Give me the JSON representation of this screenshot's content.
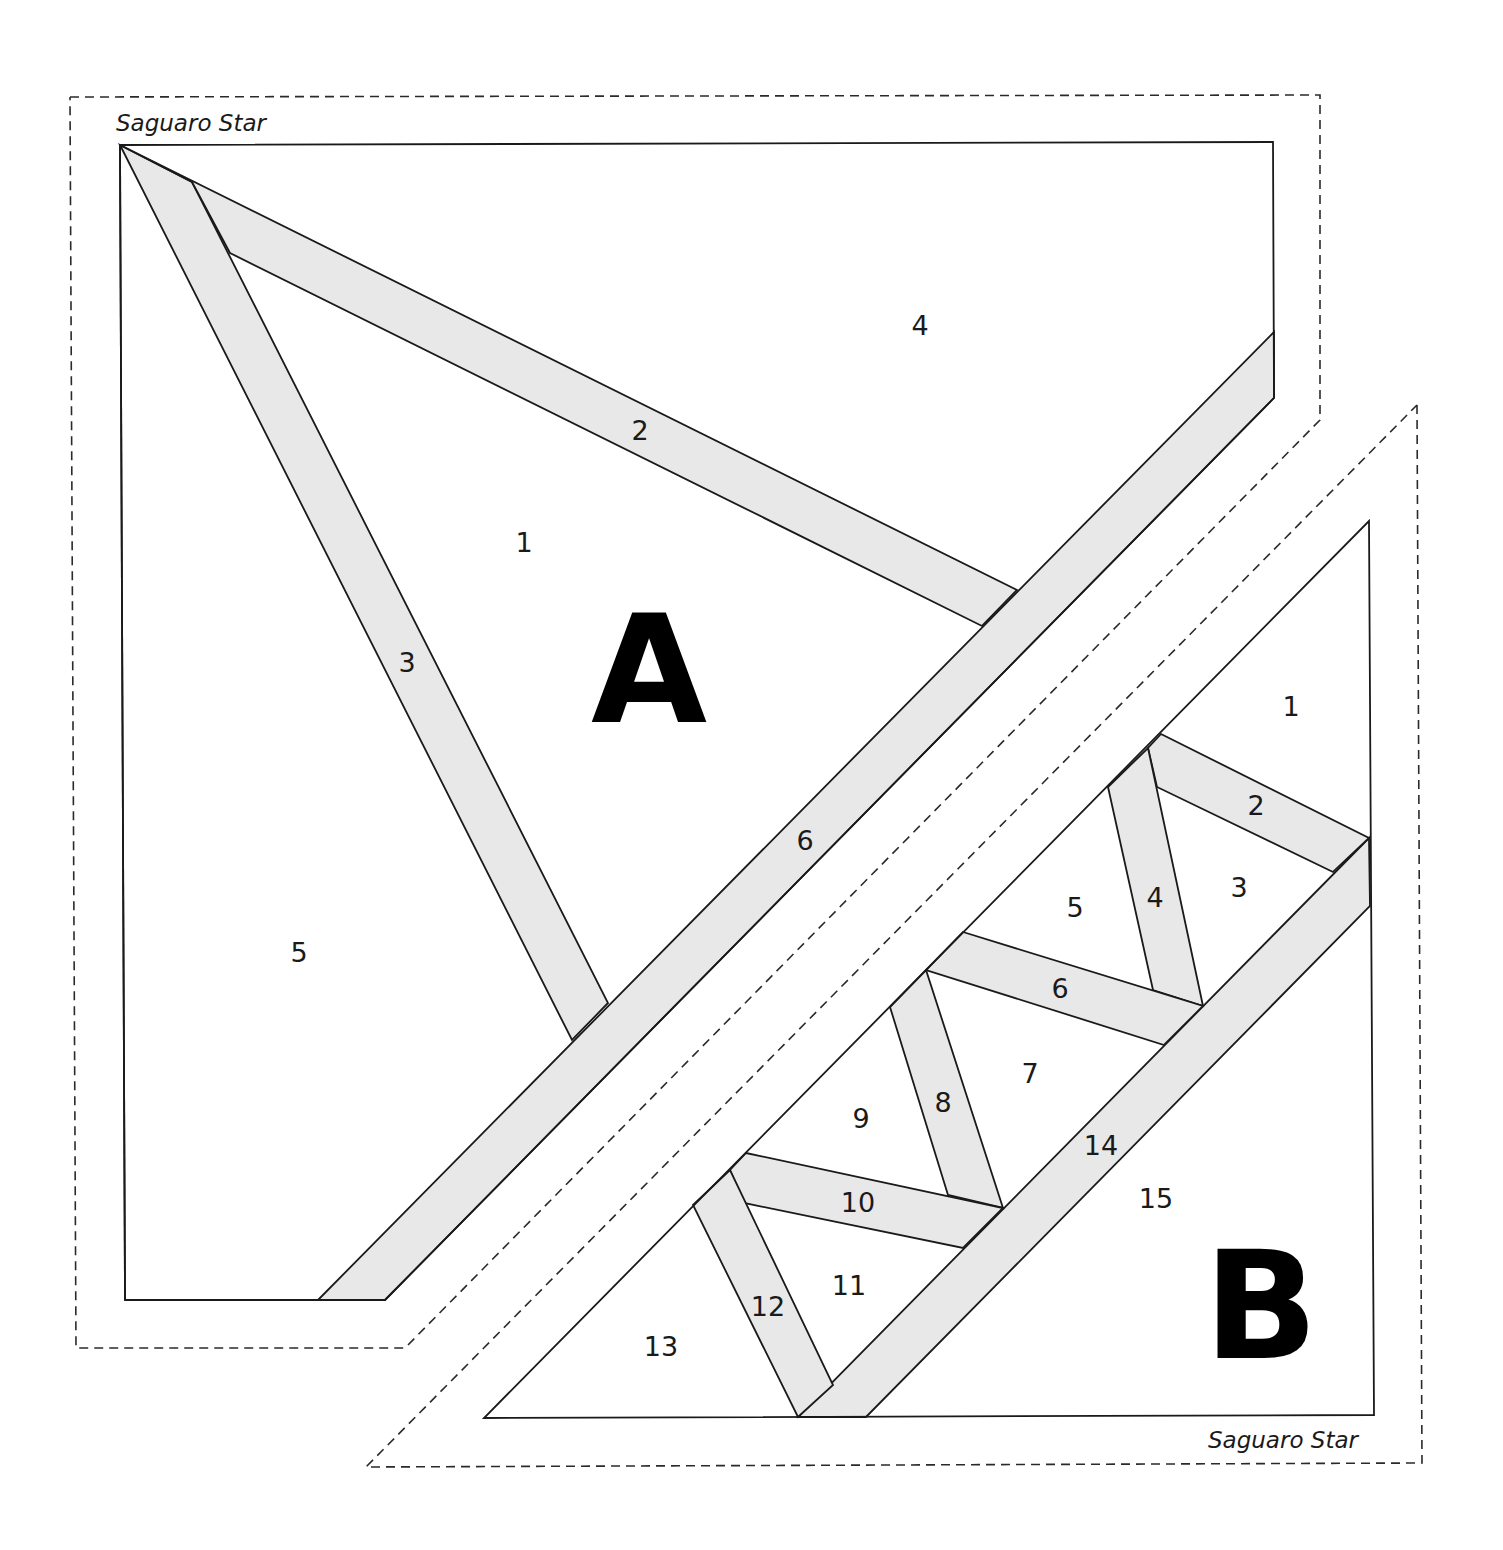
{
  "pattern": {
    "name": "Saguaro Star",
    "colors": {
      "line": "#1a1a1a",
      "strip_fill": "#e8e8e8",
      "background": "#ffffff"
    }
  },
  "section_a": {
    "letter": "A",
    "title": "Saguaro Star",
    "pieces": [
      {
        "id": "1",
        "label": "1"
      },
      {
        "id": "2",
        "label": "2"
      },
      {
        "id": "3",
        "label": "3"
      },
      {
        "id": "4",
        "label": "4"
      },
      {
        "id": "5",
        "label": "5"
      },
      {
        "id": "6",
        "label": "6"
      }
    ]
  },
  "section_b": {
    "letter": "B",
    "title": "Saguaro Star",
    "pieces": [
      {
        "id": "1",
        "label": "1"
      },
      {
        "id": "2",
        "label": "2"
      },
      {
        "id": "3",
        "label": "3"
      },
      {
        "id": "4",
        "label": "4"
      },
      {
        "id": "5",
        "label": "5"
      },
      {
        "id": "6",
        "label": "6"
      },
      {
        "id": "7",
        "label": "7"
      },
      {
        "id": "8",
        "label": "8"
      },
      {
        "id": "9",
        "label": "9"
      },
      {
        "id": "10",
        "label": "10"
      },
      {
        "id": "11",
        "label": "11"
      },
      {
        "id": "12",
        "label": "12"
      },
      {
        "id": "13",
        "label": "13"
      },
      {
        "id": "14",
        "label": "14"
      },
      {
        "id": "15",
        "label": "15"
      }
    ]
  }
}
